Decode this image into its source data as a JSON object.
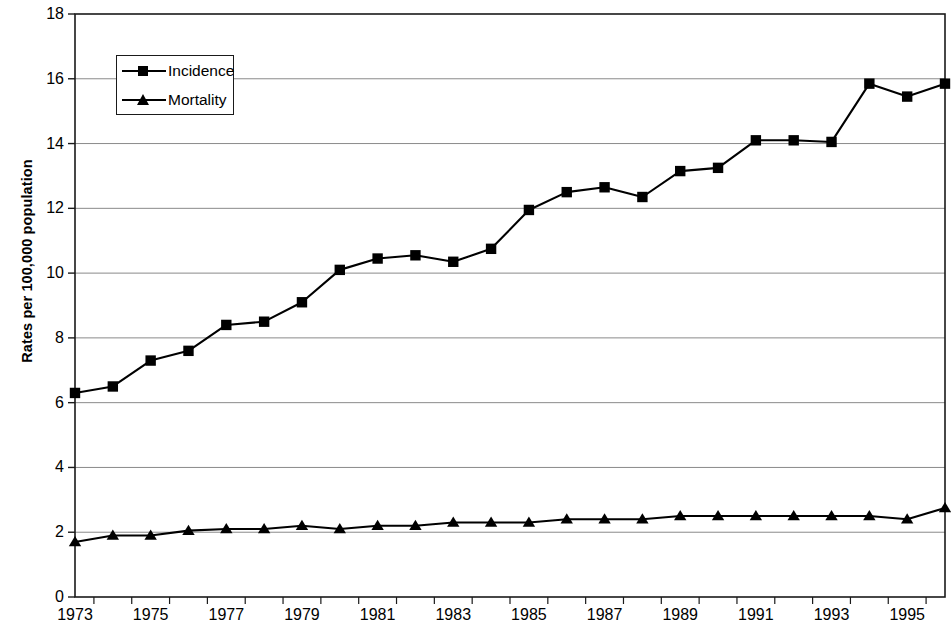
{
  "chart_data": {
    "type": "line",
    "title": "",
    "xlabel": "",
    "ylabel": "Rates per 100,000 population",
    "x": [
      1973,
      1974,
      1975,
      1976,
      1977,
      1978,
      1979,
      1980,
      1981,
      1982,
      1983,
      1984,
      1985,
      1986,
      1987,
      1988,
      1989,
      1990,
      1991,
      1992,
      1993,
      1994,
      1995,
      1996
    ],
    "xlim": [
      1973,
      1996
    ],
    "ylim": [
      0,
      18
    ],
    "yticks": [
      0,
      2,
      4,
      6,
      8,
      10,
      12,
      14,
      16,
      18
    ],
    "xticks_labeled": [
      1973,
      1975,
      1977,
      1979,
      1981,
      1983,
      1985,
      1987,
      1989,
      1991,
      1993,
      1995
    ],
    "grid": "horizontal",
    "legend_position": "top-left-inside",
    "series": [
      {
        "name": "Incidence",
        "marker": "square",
        "color": "#000000",
        "values": [
          6.3,
          6.5,
          7.3,
          7.6,
          8.4,
          8.5,
          9.1,
          10.1,
          10.45,
          10.55,
          10.35,
          10.75,
          11.95,
          12.5,
          12.65,
          12.35,
          13.15,
          13.25,
          14.1,
          14.1,
          14.05,
          15.85,
          15.45,
          15.85
        ]
      },
      {
        "name": "Mortality",
        "marker": "triangle",
        "color": "#000000",
        "values": [
          1.7,
          1.9,
          1.9,
          2.05,
          2.1,
          2.1,
          2.2,
          2.1,
          2.2,
          2.2,
          2.3,
          2.3,
          2.3,
          2.4,
          2.4,
          2.4,
          2.5,
          2.5,
          2.5,
          2.5,
          2.5,
          2.5,
          2.4,
          2.75
        ]
      }
    ]
  },
  "legend": {
    "items": [
      {
        "label": "Incidence",
        "marker": "square"
      },
      {
        "label": "Mortality",
        "marker": "triangle"
      }
    ]
  },
  "axes": {
    "y_title": "Rates per 100,000 population",
    "y_tick_labels": [
      "0",
      "2",
      "4",
      "6",
      "8",
      "10",
      "12",
      "14",
      "16",
      "18"
    ],
    "x_tick_labels": [
      "1973",
      "1975",
      "1977",
      "1979",
      "1981",
      "1983",
      "1985",
      "1987",
      "1989",
      "1991",
      "1993",
      "1995"
    ]
  },
  "colors": {
    "axis": "#1a1a1a",
    "grid": "#8a8a8a",
    "series": "#000000",
    "background": "#ffffff"
  }
}
